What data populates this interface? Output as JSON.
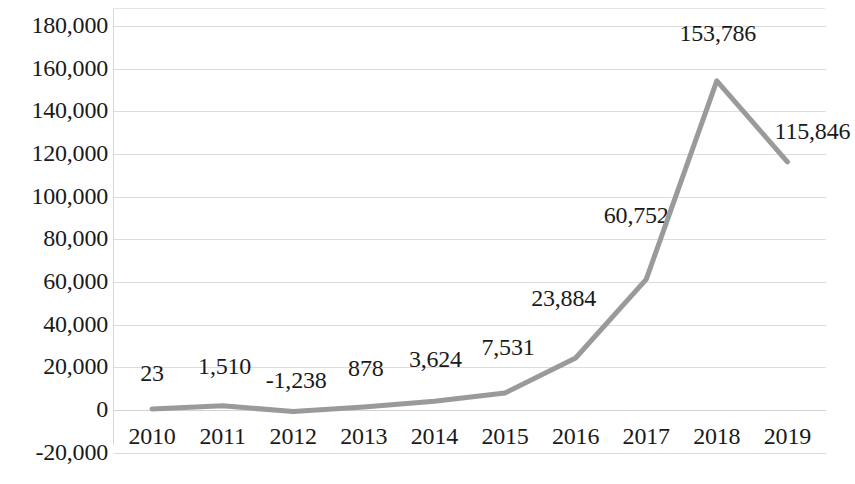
{
  "chart_data": {
    "type": "line",
    "title": "",
    "subtitle": "",
    "xlabel": "",
    "ylabel": "",
    "categories": [
      "2010",
      "2011",
      "2012",
      "2013",
      "2014",
      "2015",
      "2016",
      "2017",
      "2018",
      "2019"
    ],
    "values": [
      23,
      1510,
      -1238,
      878,
      3624,
      7531,
      23884,
      60752,
      153786,
      115846
    ],
    "data_labels": [
      "23",
      "1,510",
      "-1,238",
      "878",
      "3,624",
      "7,531",
      "23,884",
      "60,752",
      "153,786",
      "115,846"
    ],
    "series": [
      {
        "name": "",
        "values": [
          23,
          1510,
          -1238,
          878,
          3624,
          7531,
          23884,
          60752,
          153786,
          115846
        ],
        "color": "#9a9a9a"
      }
    ],
    "ylim": [
      -20000,
      180000
    ],
    "ytick_step": 20000,
    "ytick_labels": [
      "180,000",
      "160,000",
      "140,000",
      "120,000",
      "100,000",
      "80,000",
      "60,000",
      "40,000",
      "20,000",
      "0",
      "-20,000"
    ],
    "ytick_values": [
      180000,
      160000,
      140000,
      120000,
      100000,
      80000,
      60000,
      40000,
      20000,
      0,
      -20000
    ],
    "grid": true,
    "grid_color": "#dcdcdc",
    "legend": false,
    "legend_position": "none",
    "line_color": "#9a9a9a",
    "line_width": 5,
    "markers": false,
    "background": "#ffffff"
  }
}
